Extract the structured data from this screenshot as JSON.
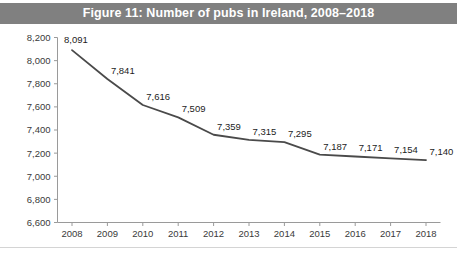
{
  "figure": {
    "title": "Figure 11: Number of pubs in Ireland, 2008–2018",
    "banner_color": "#808080",
    "banner_text_color": "#ffffff",
    "background": "#ffffff"
  },
  "chart_data": {
    "type": "line",
    "title": "Figure 11: Number of pubs in Ireland, 2008–2018",
    "xlabel": "",
    "ylabel": "",
    "categories": [
      "2008",
      "2009",
      "2010",
      "2011",
      "2012",
      "2013",
      "2014",
      "2015",
      "2016",
      "2017",
      "2018"
    ],
    "values": [
      8091,
      7841,
      7616,
      7509,
      7359,
      7315,
      7295,
      7187,
      7171,
      7154,
      7140
    ],
    "data_labels": [
      "8,091",
      "7,841",
      "7,616",
      "7,509",
      "7,359",
      "7,315",
      "7,295",
      "7,187",
      "7,171",
      "7,154",
      "7,140"
    ],
    "ylim": [
      6600,
      8200
    ],
    "ytick_values": [
      6600,
      6800,
      7000,
      7200,
      7400,
      7600,
      7800,
      8000,
      8200
    ],
    "ytick_labels": [
      "6,600",
      "6,800",
      "7,000",
      "7,200",
      "7,400",
      "7,600",
      "7,800",
      "8,000",
      "8,200"
    ],
    "grid": false,
    "legend": "none",
    "series": [
      {
        "name": "Number of pubs",
        "color": "#4a4a4a",
        "values": [
          8091,
          7841,
          7616,
          7509,
          7359,
          7315,
          7295,
          7187,
          7171,
          7154,
          7140
        ]
      }
    ],
    "line_color": "#4a4a4a",
    "axis_color": "#9a9a9a",
    "tick_label_color": "#3a3a3a",
    "data_label_color": "#1c1c1c"
  }
}
